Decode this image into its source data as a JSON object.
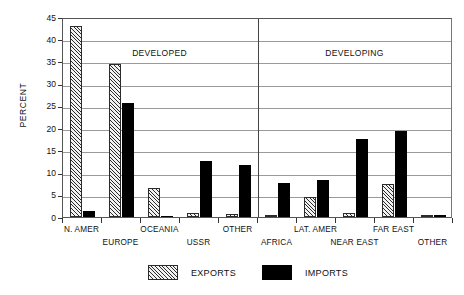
{
  "chart_data": {
    "type": "bar",
    "title": "",
    "xlabel": "",
    "ylabel": "PERCENT",
    "ylim": [
      0,
      45
    ],
    "ytick_step": 5,
    "yticks": [
      "0",
      "5",
      "10",
      "15",
      "20",
      "25",
      "30",
      "35",
      "40",
      "45"
    ],
    "grid": true,
    "legend_position": "bottom",
    "categories": [
      "N. AMER",
      "EUROPE",
      "OCEANIA",
      "USSR",
      "OTHER",
      "AFRICA",
      "LAT. AMER",
      "NEAR EAST",
      "FAR EAST",
      "OTHER"
    ],
    "series": [
      {
        "name": "EXPORTS",
        "color": "#f2f2f2",
        "values": [
          43.0,
          34.5,
          6.6,
          0.8,
          0.6,
          0.4,
          4.5,
          1.0,
          7.4,
          0.1
        ]
      },
      {
        "name": "IMPORTS",
        "color": "#000000",
        "values": [
          1.3,
          25.6,
          0.3,
          12.5,
          11.6,
          7.6,
          8.3,
          17.5,
          19.3,
          0.4
        ]
      }
    ],
    "annotations": [
      {
        "text": "DEVELOPED",
        "group_start": 0,
        "group_end": 4
      },
      {
        "text": "DEVELOPING",
        "group_start": 5,
        "group_end": 9
      }
    ],
    "group_divider_after_category": 4
  },
  "legend": {
    "exports_label": "EXPORTS",
    "imports_label": "IMPORTS"
  }
}
